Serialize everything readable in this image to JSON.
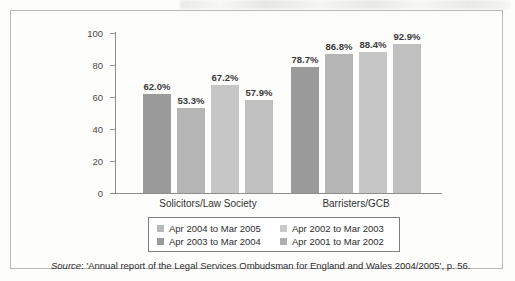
{
  "chart_data": {
    "type": "bar",
    "title": "",
    "xlabel": "",
    "ylabel": "",
    "ylim": [
      0,
      100
    ],
    "yticks": [
      0,
      20,
      40,
      60,
      80,
      100
    ],
    "ytick_labels": [
      "0",
      "20",
      "40",
      "60",
      "80",
      "100"
    ],
    "grid": false,
    "legend_position": "bottom",
    "categories": [
      "Solicitors/Law Society",
      "Barristers/GCB"
    ],
    "series": [
      {
        "name": "Apr 2004 to Mar 2005",
        "color": "#9a9a9a",
        "values": [
          62.0,
          78.7
        ],
        "labels": [
          "62.0%",
          "78.7%"
        ]
      },
      {
        "name": "Apr 2003 to Mar 2004",
        "color": "#b5b5b5",
        "values": [
          53.3,
          86.8
        ],
        "labels": [
          "53.3%",
          "86.8%"
        ]
      },
      {
        "name": "Apr 2002 to Mar 2003",
        "color": "#c6c6c6",
        "values": [
          67.2,
          88.4
        ],
        "labels": [
          "67.2%",
          "88.4%"
        ]
      },
      {
        "name": "Apr 2001 to Mar 2002",
        "color": "#c0c0c0",
        "values": [
          57.9,
          92.9
        ],
        "labels": [
          "57.9%",
          "92.9%"
        ]
      }
    ]
  },
  "legend": {
    "entries": [
      {
        "label": "Apr 2004 to Mar 2005",
        "color": "#b8b8b8"
      },
      {
        "label": "Apr 2003 to Mar 2004",
        "color": "#9a9a9a"
      },
      {
        "label": "Apr 2002 to Mar 2003",
        "color": "#c9c9c9"
      },
      {
        "label": "Apr 2001 to Mar 2002",
        "color": "#aeaeae"
      }
    ]
  },
  "source": {
    "prefix": "Source",
    "text": ": 'Annual report of the Legal Services Ombudsman for England and Wales 2004/2005', p. 56."
  }
}
